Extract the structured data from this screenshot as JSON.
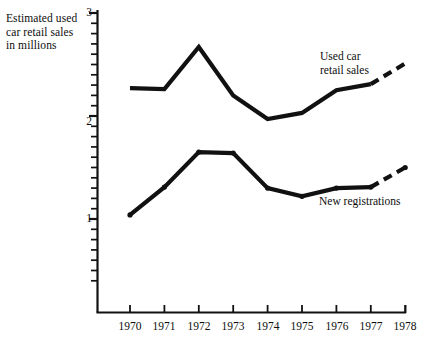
{
  "chart_data": {
    "type": "line",
    "title": "",
    "ylabel": "Estimated used\ncar retail sales\nin millions",
    "xlabel": "",
    "ylim": [
      0,
      3
    ],
    "y_ticks_major": [
      "1",
      "2",
      "3"
    ],
    "y_tick_values_major": [
      1,
      2,
      3
    ],
    "y_minor_tick_count_per_unit": 10,
    "grid": false,
    "legend": "inline-annotations",
    "categories": [
      "1970",
      "1971",
      "1972",
      "1973",
      "1974",
      "1975",
      "1976",
      "1977",
      "1978"
    ],
    "x": [
      1970,
      1971,
      1972,
      1973,
      1974,
      1975,
      1976,
      1977,
      1978
    ],
    "series": [
      {
        "name": "Used car retail sales",
        "label": "Used car\nretail sales",
        "style": "solid-thick",
        "markers": false,
        "values": [
          2.27,
          2.26,
          2.67,
          2.2,
          1.97,
          2.03,
          2.25,
          2.31,
          2.51
        ],
        "projected_from": 1977,
        "projected_style": "dashed"
      },
      {
        "name": "New registrations",
        "label": "New registrations",
        "style": "solid-thick-with-dots",
        "markers": true,
        "values": [
          1.04,
          1.31,
          1.65,
          1.64,
          1.3,
          1.22,
          1.3,
          1.31,
          1.5
        ],
        "projected_from": 1977,
        "projected_style": "dashed"
      }
    ],
    "colors": {
      "line": "#111111",
      "axis": "#111111",
      "text": "#0d0d0d",
      "background": "#ffffff"
    }
  },
  "annotations": {
    "used_car_label": "Used car\nretail sales",
    "new_registrations_label": "New registrations"
  },
  "axes": {
    "y_label": "Estimated used\ncar retail sales\nin millions",
    "y_tick_3": "3",
    "y_tick_2": "2",
    "y_tick_1": "1",
    "x_tick_1970": "1970",
    "x_tick_1971": "1971",
    "x_tick_1972": "1972",
    "x_tick_1973": "1973",
    "x_tick_1974": "1974",
    "x_tick_1975": "1975",
    "x_tick_1976": "1976",
    "x_tick_1977": "1977",
    "x_tick_1978": "1978"
  }
}
